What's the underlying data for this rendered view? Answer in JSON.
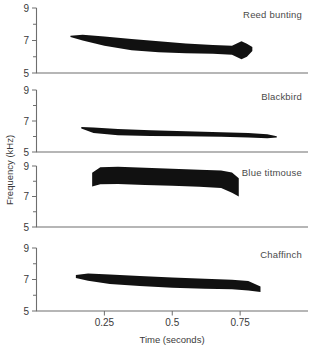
{
  "figure": {
    "name": "bird-song-sonograms",
    "x_axis": {
      "label": "Time (seconds)",
      "ticks": [
        "0.25",
        "0.5",
        "0.75"
      ],
      "tick_values": [
        0.25,
        0.5,
        0.75
      ],
      "range": [
        0.0,
        1.0
      ]
    },
    "y_axis": {
      "label": "Frequency (kHz)",
      "ticks": [
        "5",
        "7",
        "9"
      ],
      "tick_values": [
        5,
        7,
        9
      ],
      "minor_tick_values": [
        6,
        8
      ],
      "range": [
        5,
        9
      ],
      "units": "kHz"
    },
    "colors": {
      "trace": "#111111",
      "axis": "#6e6e6e",
      "text": "#3a3a3a",
      "background": "#ffffff"
    }
  },
  "chart_data": {
    "type": "area",
    "title": "",
    "xlabel": "Time (seconds)",
    "ylabel": "Frequency (kHz)",
    "xlim": [
      0.0,
      1.0
    ],
    "ylim": [
      5,
      9
    ],
    "grid": false,
    "legend": "none",
    "panel_layout": "4 stacked panels, shared x-axis at bottom",
    "panels": [
      {
        "index": 0,
        "label": "Reed bunting",
        "label_position": "top-right",
        "t_start": 0.125,
        "t_end": 0.795,
        "upper": {
          "t": [
            0.125,
            0.17,
            0.25,
            0.35,
            0.45,
            0.55,
            0.65,
            0.72,
            0.755,
            0.775,
            0.795
          ],
          "f": [
            7.3,
            7.35,
            7.25,
            7.1,
            6.95,
            6.82,
            6.72,
            6.68,
            6.95,
            6.8,
            6.6
          ]
        },
        "lower": {
          "t": [
            0.125,
            0.17,
            0.25,
            0.35,
            0.45,
            0.55,
            0.65,
            0.72,
            0.755,
            0.775,
            0.795
          ],
          "f": [
            7.22,
            7.0,
            6.68,
            6.4,
            6.28,
            6.22,
            6.18,
            6.12,
            5.85,
            6.0,
            6.35
          ]
        }
      },
      {
        "index": 1,
        "label": "Blackbird",
        "label_position": "top-right",
        "t_start": 0.165,
        "t_end": 0.885,
        "upper": {
          "t": [
            0.165,
            0.21,
            0.3,
            0.42,
            0.55,
            0.68,
            0.78,
            0.85,
            0.885
          ],
          "f": [
            6.62,
            6.58,
            6.48,
            6.4,
            6.34,
            6.28,
            6.22,
            6.14,
            6.02
          ]
        },
        "lower": {
          "t": [
            0.165,
            0.21,
            0.3,
            0.42,
            0.55,
            0.68,
            0.78,
            0.85,
            0.885
          ],
          "f": [
            6.52,
            6.22,
            6.08,
            6.04,
            6.02,
            5.98,
            5.94,
            5.88,
            5.94
          ]
        }
      },
      {
        "index": 2,
        "label": "Blue titmouse",
        "label_position": "top-right",
        "t_start": 0.205,
        "t_end": 0.745,
        "upper": {
          "t": [
            0.205,
            0.235,
            0.3,
            0.4,
            0.5,
            0.6,
            0.68,
            0.72,
            0.745
          ],
          "f": [
            8.55,
            8.92,
            8.95,
            8.88,
            8.82,
            8.76,
            8.7,
            8.58,
            8.2
          ]
        },
        "lower": {
          "t": [
            0.205,
            0.235,
            0.3,
            0.4,
            0.5,
            0.6,
            0.68,
            0.72,
            0.745
          ],
          "f": [
            7.65,
            7.8,
            7.82,
            7.76,
            7.7,
            7.64,
            7.55,
            7.25,
            7.0
          ]
        }
      },
      {
        "index": 3,
        "label": "Chaffinch",
        "label_position": "top-right",
        "t_start": 0.145,
        "t_end": 0.825,
        "upper": {
          "t": [
            0.145,
            0.19,
            0.27,
            0.38,
            0.5,
            0.62,
            0.72,
            0.78,
            0.825
          ],
          "f": [
            7.28,
            7.38,
            7.32,
            7.22,
            7.12,
            7.05,
            6.98,
            6.9,
            6.55
          ]
        },
        "lower": {
          "t": [
            0.145,
            0.19,
            0.27,
            0.38,
            0.5,
            0.62,
            0.72,
            0.78,
            0.825
          ],
          "f": [
            7.1,
            6.92,
            6.72,
            6.58,
            6.48,
            6.42,
            6.38,
            6.3,
            6.2
          ]
        }
      }
    ]
  }
}
